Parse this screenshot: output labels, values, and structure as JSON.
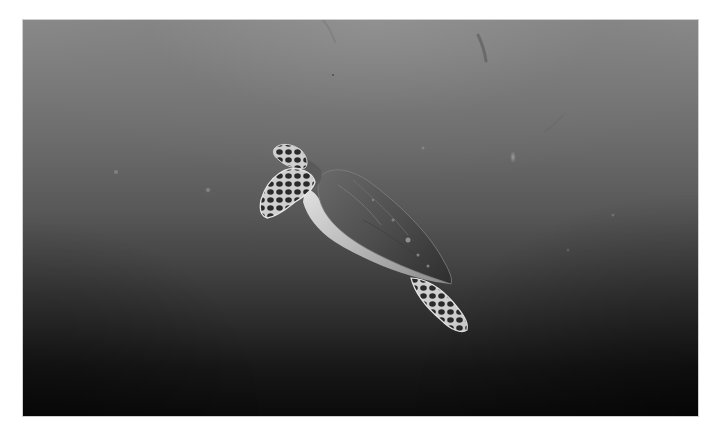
{
  "image": {
    "alt": "Grayscale underwater photograph of a sea turtle swimming diagonally upward in open water, with surface light fading to dark depths",
    "subject": "sea turtle",
    "tone": "monochrome",
    "colors": {
      "page_background": "#ffffff",
      "water_top": "#8a8a8a",
      "water_mid": "#585858",
      "water_bottom": "#0b0b0b",
      "shell": "#4a4a4a",
      "plastron_highlight": "#d8d8d8",
      "flipper_scales": "#2a2a2a"
    }
  }
}
